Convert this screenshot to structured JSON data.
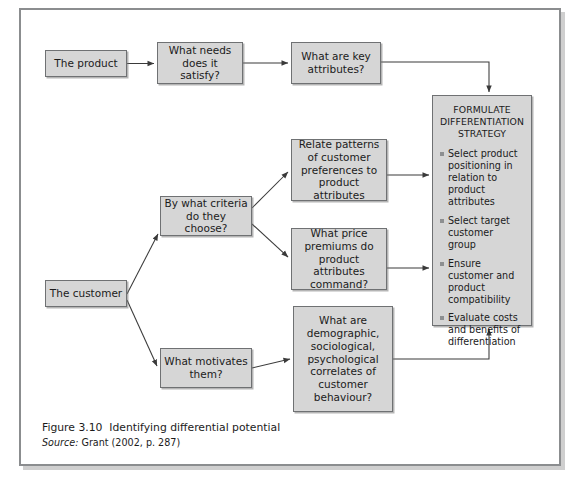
{
  "figure": {
    "caption_figure_number": "Figure 3.10",
    "caption_title": "Identifying differential potential",
    "source_label": "Source:",
    "source_text": "Grant (2002, p. 287)"
  },
  "colors": {
    "box_fill": "#d6d6d6",
    "box_border": "#6f7173",
    "frame_border": "#8b8d8f",
    "text": "#1b1b1b",
    "bullet_marker": "#8d8f91",
    "wire": "#3a3a3a"
  },
  "nodes": {
    "product": "The product",
    "needs": "What needs does it satisfy?",
    "key_attributes": "What are key attributes?",
    "customer": "The customer",
    "criteria": "By what criteria do they choose?",
    "relate_patterns": "Relate patterns of customer preferences to product attributes",
    "price_premiums": "What price premiums do product attributes command?",
    "motivates": "What motivates them?",
    "demographic": "What are demographic, sociological, psychological correlates of customer behaviour?"
  },
  "panel": {
    "title_line_1": "FORMULATE",
    "title_line_2": "DIFFERENTIATION",
    "title_line_3": "STRATEGY",
    "bullets": [
      "Select product positioning in relation to product attributes",
      "Select target customer group",
      "Ensure customer and product compatibility",
      "Evaluate costs and benefits of differentiation"
    ]
  },
  "icons": {
    "bullet": "square-bullet-icon",
    "arrow": "arrow-head-icon"
  }
}
